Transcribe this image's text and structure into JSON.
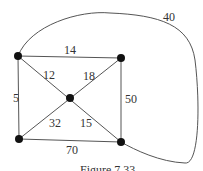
{
  "diagram": {
    "type": "weighted-graph",
    "nodes": [
      {
        "id": "A",
        "position": "top-left",
        "x": 18,
        "y": 56
      },
      {
        "id": "B",
        "position": "top-right",
        "x": 121,
        "y": 58
      },
      {
        "id": "C",
        "position": "center",
        "x": 70,
        "y": 98
      },
      {
        "id": "D",
        "position": "bottom-left",
        "x": 19,
        "y": 139
      },
      {
        "id": "E",
        "position": "bottom-right",
        "x": 121,
        "y": 142
      }
    ],
    "edges": [
      {
        "from": "A",
        "to": "B",
        "weight": "14"
      },
      {
        "from": "A",
        "to": "D",
        "weight": "5"
      },
      {
        "from": "A",
        "to": "C",
        "weight": "12"
      },
      {
        "from": "B",
        "to": "C",
        "weight": "18"
      },
      {
        "from": "B",
        "to": "E",
        "weight": "50"
      },
      {
        "from": "D",
        "to": "C",
        "weight": "32"
      },
      {
        "from": "C",
        "to": "E",
        "weight": "15"
      },
      {
        "from": "D",
        "to": "E",
        "weight": "70"
      },
      {
        "from": "A",
        "to": "E",
        "weight": "40",
        "style": "curved"
      }
    ],
    "caption": "Figure 7.33"
  }
}
